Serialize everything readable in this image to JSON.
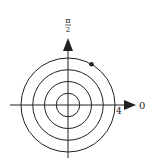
{
  "diagram": {
    "type": "polar-grid",
    "center": {
      "x": 68,
      "y": 105
    },
    "circles": [
      {
        "r": 1,
        "px": 11.75
      },
      {
        "r": 2,
        "px": 23.5
      },
      {
        "r": 3,
        "px": 35.25
      },
      {
        "r": 4,
        "px": 47
      }
    ],
    "labels": {
      "top_axis_num": "π",
      "top_axis_den": "2",
      "right_axis": "0",
      "radius_tick": "4"
    },
    "point": {
      "r": 4,
      "theta_deg": 60
    },
    "colors": {
      "line": "#222222",
      "background": "#ffffff"
    }
  }
}
